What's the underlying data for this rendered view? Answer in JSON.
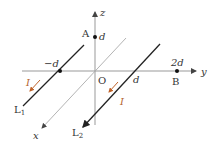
{
  "diagram": {
    "axes": {
      "x_label": "x",
      "y_label": "y",
      "z_label": "z",
      "origin_label": "O"
    },
    "points": {
      "A": {
        "label": "A",
        "coord_label": "d"
      },
      "B": {
        "label": "B",
        "coord_label": "2d"
      },
      "L1_y": {
        "coord_label": "−d"
      },
      "L2_y": {
        "coord_label": "d"
      }
    },
    "wires": [
      {
        "name": "L1",
        "label": "L",
        "subscript": "1",
        "current_label": "I"
      },
      {
        "name": "L2",
        "label": "L",
        "subscript": "2",
        "current_label": "I"
      }
    ],
    "colors": {
      "axis": "#999999",
      "wire": "#222222",
      "current_arrow": "#c0632a",
      "text": "#333333"
    }
  }
}
